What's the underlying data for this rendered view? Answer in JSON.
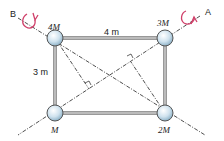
{
  "diagram": {
    "axis_labels": {
      "A": "A",
      "B": "B"
    },
    "masses": {
      "top_left": "4M",
      "top_right": "3M",
      "bottom_left": "M",
      "bottom_right": "2M"
    },
    "dimensions": {
      "width": "4 m",
      "height": "3 m"
    },
    "colors": {
      "rotation_arrow": "#d0406a",
      "sphere": "#cfe2ee",
      "frame": "#555555"
    }
  }
}
